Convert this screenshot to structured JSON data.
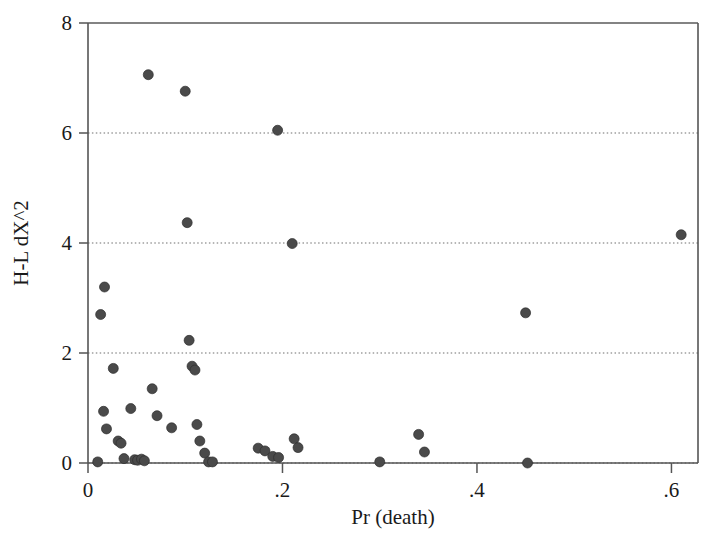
{
  "figure": {
    "background_color": "#ffffff",
    "marker_color": "#4a4a4a",
    "grid_color": "#6f6f6f",
    "axis_color": "#555555"
  },
  "chart_data": {
    "type": "scatter",
    "title": "",
    "xlabel": "Pr (death)",
    "ylabel": "H-L dX^2",
    "xlim": [
      0.0,
      0.6273
    ],
    "ylim": [
      0.0,
      8.0
    ],
    "xticks": [
      0,
      0.2,
      0.4,
      0.6
    ],
    "xtick_labels": [
      "0",
      ".2",
      ".4",
      ".6"
    ],
    "yticks": [
      0,
      2,
      4,
      6,
      8
    ],
    "ytick_labels": [
      "0",
      "2",
      "4",
      "6",
      "8"
    ],
    "grid": true,
    "grid_axis": "y",
    "legend": null,
    "series": [
      {
        "name": "observations",
        "marker": "circle",
        "points": [
          [
            0.01,
            0.02
          ],
          [
            0.013,
            2.7
          ],
          [
            0.017,
            3.2
          ],
          [
            0.016,
            0.94
          ],
          [
            0.019,
            0.62
          ],
          [
            0.026,
            1.72
          ],
          [
            0.031,
            0.4
          ],
          [
            0.034,
            0.36
          ],
          [
            0.037,
            0.08
          ],
          [
            0.044,
            0.99
          ],
          [
            0.048,
            0.06
          ],
          [
            0.051,
            0.05
          ],
          [
            0.055,
            0.07
          ],
          [
            0.058,
            0.04
          ],
          [
            0.062,
            7.06
          ],
          [
            0.066,
            1.35
          ],
          [
            0.071,
            0.86
          ],
          [
            0.086,
            0.64
          ],
          [
            0.1,
            6.76
          ],
          [
            0.102,
            4.37
          ],
          [
            0.104,
            2.23
          ],
          [
            0.107,
            1.76
          ],
          [
            0.11,
            1.69
          ],
          [
            0.112,
            0.7
          ],
          [
            0.115,
            0.4
          ],
          [
            0.12,
            0.18
          ],
          [
            0.124,
            0.02
          ],
          [
            0.128,
            0.02
          ],
          [
            0.175,
            0.27
          ],
          [
            0.182,
            0.22
          ],
          [
            0.19,
            0.12
          ],
          [
            0.195,
            6.05
          ],
          [
            0.196,
            0.1
          ],
          [
            0.21,
            3.99
          ],
          [
            0.212,
            0.44
          ],
          [
            0.216,
            0.28
          ],
          [
            0.3,
            0.02
          ],
          [
            0.34,
            0.52
          ],
          [
            0.346,
            0.2
          ],
          [
            0.45,
            2.73
          ],
          [
            0.452,
            0.0
          ],
          [
            0.61,
            4.15
          ]
        ]
      }
    ]
  },
  "axis": {
    "x_title": "Pr (death)",
    "y_title": "H-L dX^2",
    "x_tick_0": "0",
    "x_tick_1": ".2",
    "x_tick_2": ".4",
    "x_tick_3": ".6",
    "y_tick_0": "0",
    "y_tick_1": "2",
    "y_tick_2": "4",
    "y_tick_3": "6",
    "y_tick_4": "8"
  }
}
